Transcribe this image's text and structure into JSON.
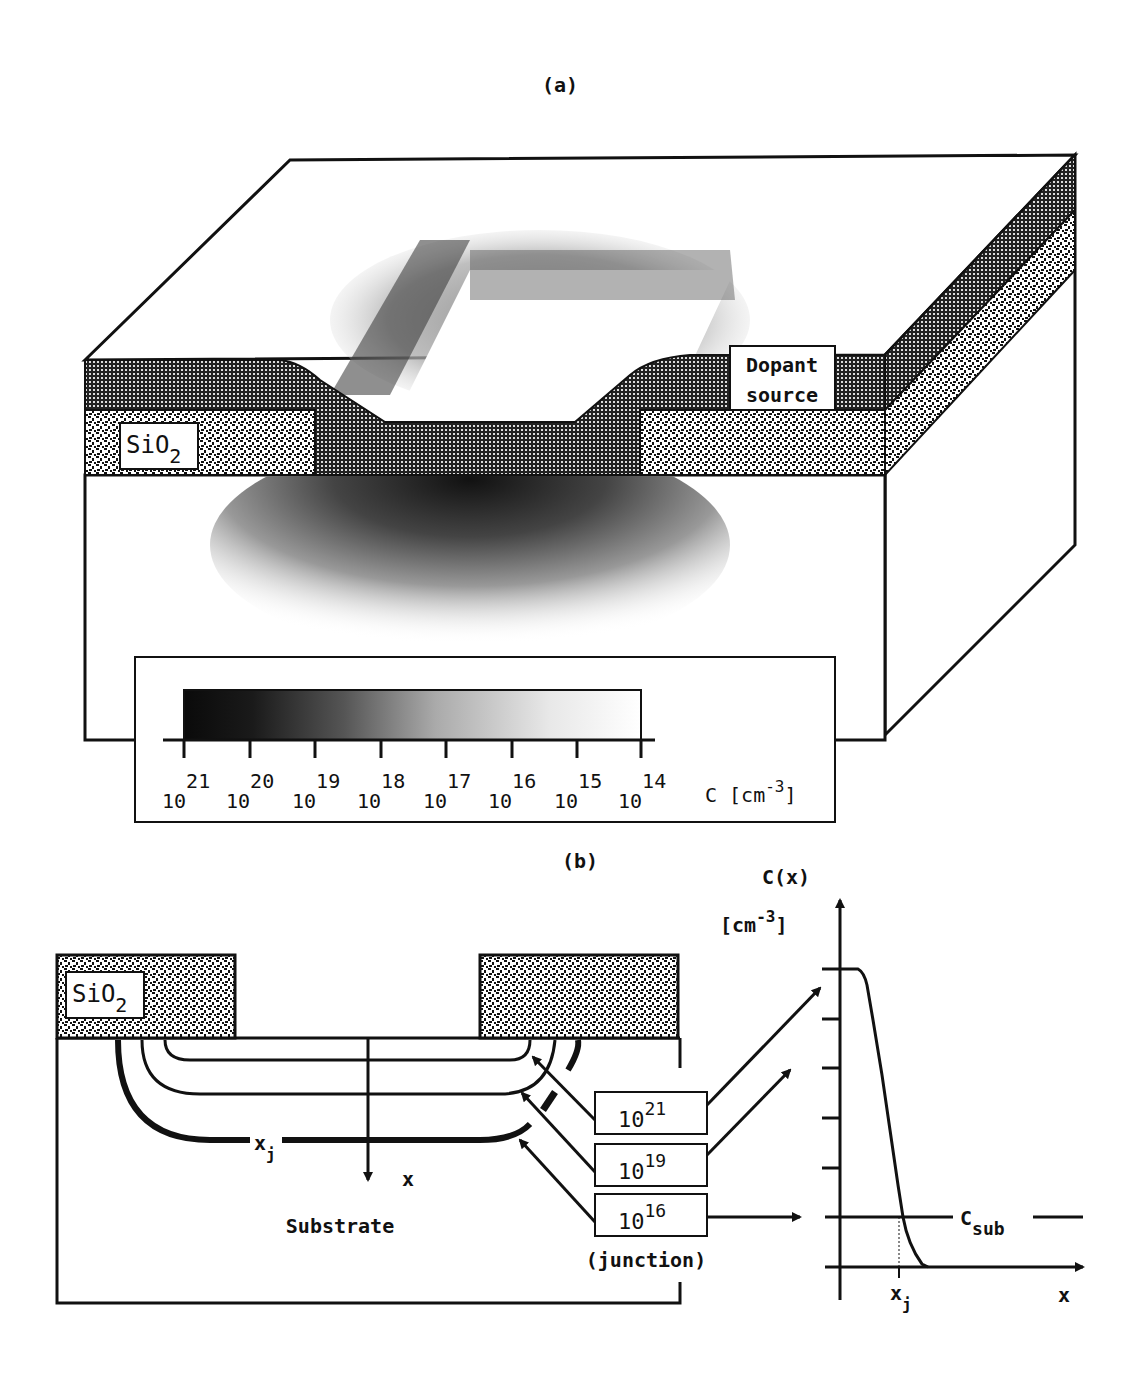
{
  "panel_a": {
    "label": "(a)",
    "sio2_label": "SiO",
    "sio2_sub": "2",
    "dopant_label_line1": "Dopant",
    "dopant_label_line2": "source",
    "scale": {
      "ticks": [
        {
          "base": "10",
          "exp": "21"
        },
        {
          "base": "10",
          "exp": "20"
        },
        {
          "base": "10",
          "exp": "19"
        },
        {
          "base": "10",
          "exp": "18"
        },
        {
          "base": "10",
          "exp": "17"
        },
        {
          "base": "10",
          "exp": "16"
        },
        {
          "base": "10",
          "exp": "15"
        },
        {
          "base": "10",
          "exp": "14"
        }
      ],
      "unit_prefix": "C [cm",
      "unit_exp": "-3",
      "unit_suffix": "]"
    }
  },
  "panel_b": {
    "label": "(b)",
    "sio2_label": "SiO",
    "sio2_sub": "2",
    "xj_label": "x",
    "xj_sub": "j",
    "x_axis_label": "x",
    "substrate_label": "Substrate",
    "contours": [
      {
        "base": "10",
        "exp": "21"
      },
      {
        "base": "10",
        "exp": "19"
      },
      {
        "base": "10",
        "exp": "16"
      }
    ],
    "junction_label": "(junction)",
    "plot": {
      "y_label": "C(x)",
      "y_unit_prefix": "[cm",
      "y_unit_exp": "-3",
      "y_unit_suffix": "]",
      "csub_label": "C",
      "csub_sub": "sub",
      "x_label": "x",
      "xj_label": "x",
      "xj_sub": "j"
    }
  },
  "colors": {
    "ink": "#111111",
    "paper": "#ffffff"
  }
}
